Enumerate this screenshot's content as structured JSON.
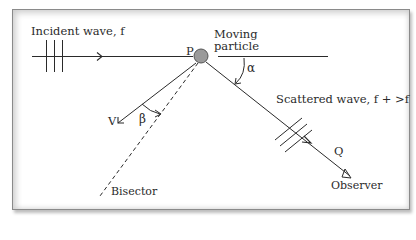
{
  "diagram": {
    "labels": {
      "incident": "Incident wave, f",
      "point_p": "P",
      "moving_particle_line1": "Moving",
      "moving_particle_line2": "particle",
      "alpha": "α",
      "velocity": "V",
      "beta": "β",
      "scattered": "Scattered wave, f + >f",
      "point_q": "Q",
      "observer": "Observer",
      "bisector": "Bisector"
    },
    "colors": {
      "line": "#2a2a2a",
      "particle_fill": "#9a9a9a",
      "particle_stroke": "#555555",
      "frame_border": "#8a8a8a"
    }
  }
}
